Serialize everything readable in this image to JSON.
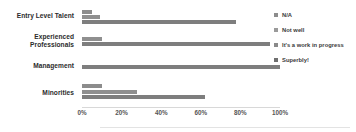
{
  "chart_data": {
    "type": "bar",
    "orientation": "horizontal",
    "title": "",
    "xlabel": "",
    "ylabel": "",
    "xlim": [
      0,
      100
    ],
    "xticks": [
      "0%",
      "20%",
      "40%",
      "60%",
      "80%",
      "100%"
    ],
    "xtick_values": [
      0,
      20,
      40,
      60,
      80,
      100
    ],
    "grid": false,
    "legend_position": "right",
    "categories": [
      "Entry Level Talent",
      "Experienced Professionals",
      "Management",
      "Minorities"
    ],
    "series": [
      {
        "name": "N/A",
        "color": "#8c8c8c",
        "values": [
          5,
          0,
          0,
          10
        ]
      },
      {
        "name": "Not well",
        "color": "#8f8f8f",
        "values": [
          9,
          10,
          0,
          28
        ]
      },
      {
        "name": "It's a work in progress",
        "color": "#7e7e7e",
        "values": [
          78,
          95,
          100,
          62
        ]
      },
      {
        "name": "Superbly!",
        "color": "#6f6f6f",
        "values": [
          0,
          0,
          0,
          0
        ]
      }
    ]
  },
  "legend": {
    "items": [
      {
        "label": "N/A",
        "color": "#8c8c8c"
      },
      {
        "label": "Not well",
        "color": "#9a9a9a"
      },
      {
        "label": "It's a work in progress",
        "color": "#8a8a8a"
      },
      {
        "label": "Superbly!",
        "color": "#6f6f6f"
      }
    ]
  },
  "axis": {
    "ticks": [
      "0%",
      "20%",
      "40%",
      "60%",
      "80%",
      "100%"
    ]
  },
  "colors": {
    "bar_light": "#a0a0a0",
    "bar_mid": "#8f8f8f",
    "bar_dark": "#7b7b7b",
    "axis_line": "#d8d8d8",
    "label_text": "#2b2b2b",
    "tick_text": "#555555"
  }
}
